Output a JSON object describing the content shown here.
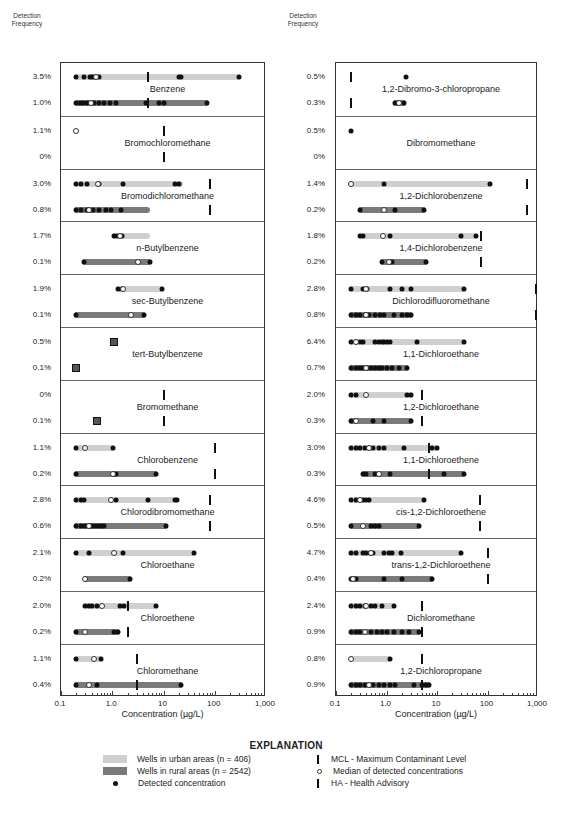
{
  "header": {
    "detection_frequency_label_line1": "Detection",
    "detection_frequency_label_line2": "Frequency"
  },
  "axis": {
    "ticks": [
      "0.1",
      "1.0",
      "10",
      "100",
      "1,000"
    ],
    "tick_values": [
      0.1,
      1,
      10,
      100,
      1000
    ],
    "xlabel": "Concentration (µg/L)"
  },
  "colors": {
    "urban": "#cfcfcf",
    "rural": "#7a7a7a",
    "detected": "#111111",
    "mcl": "#111111"
  },
  "explanation": {
    "title": "EXPLANATION",
    "urban": "Wells in urban areas (n = 406)",
    "rural": "Wells in rural areas (n = 2542)",
    "detected": "Detected concentration",
    "mcl": "MCL - Maximum Contaminant Level",
    "median": "Median of detected concentrations",
    "ha": "HA - Health Advisory"
  },
  "chart_data": {
    "type": "strip/range",
    "title": "",
    "xlabel": "Concentration (µg/L)",
    "xscale": "log",
    "xlim": [
      0.1,
      1000
    ],
    "legend": [
      "Wells in urban areas (n = 406)",
      "Wells in rural areas (n = 2542)",
      "Detected concentration",
      "MCL - Maximum Contaminant Level",
      "Median of detected concentrations",
      "HA - Health Advisory"
    ],
    "panels": [
      [
        {
          "name": "Benzene",
          "urban": {
            "freq": "3.5%",
            "range": [
              0.2,
              300
            ],
            "dots": [
              0.2,
              0.28,
              0.36,
              0.4,
              0.44,
              0.55,
              20,
              22,
              300
            ],
            "median": 0.48
          },
          "rural": {
            "freq": "1.0%",
            "range": [
              0.2,
              70
            ],
            "dots": [
              0.2,
              0.23,
              0.27,
              0.32,
              0.45,
              0.55,
              0.7,
              0.9,
              1.2,
              4.5,
              8,
              10,
              70
            ],
            "median": 0.38
          },
          "mcl": 5
        },
        {
          "name": "Bromochloromethane",
          "urban": {
            "freq": "1.1%",
            "range": null,
            "dots": [],
            "median": 0.2
          },
          "rural": {
            "freq": "0%",
            "range": null,
            "dots": [],
            "median": null
          },
          "mcl": 10
        },
        {
          "name": "Bromodichloromethane",
          "urban": {
            "freq": "3.0%",
            "range": [
              0.2,
              22
            ],
            "dots": [
              0.2,
              0.25,
              0.32,
              0.55,
              1.6,
              17,
              20
            ],
            "median": 0.52
          },
          "rural": {
            "freq": "0.8%",
            "range": [
              0.2,
              5
            ],
            "dots": [
              0.2,
              0.25,
              0.32,
              0.42,
              0.55,
              0.75,
              0.95,
              1.5
            ],
            "median": 0.35
          },
          "mcl": 80
        },
        {
          "name": "n-Butylbenzene",
          "urban": {
            "freq": "1.7%",
            "range": [
              1.1,
              5
            ],
            "dots": [
              1.1,
              1.25,
              1.55
            ],
            "median": 1.4
          },
          "rural": {
            "freq": "0.1%",
            "range": [
              0.28,
              5.5
            ],
            "dots": [
              0.28,
              5.5
            ],
            "median": 3.2
          }
        },
        {
          "name": "sec-Butylbenzene",
          "urban": {
            "freq": "1.9%",
            "range": [
              1.3,
              9.5
            ],
            "dots": [
              1.3,
              1.55,
              9.5
            ],
            "median": 1.6
          },
          "rural": {
            "freq": "0.1%",
            "range": [
              0.2,
              4.2
            ],
            "dots": [
              0.2,
              4.2
            ],
            "median": 2.3
          }
        },
        {
          "name": "tert-Butylbenzene",
          "urban": {
            "freq": "0.5%",
            "range": null,
            "dots": [
              1.1
            ],
            "median": null,
            "square": true
          },
          "rural": {
            "freq": "0.1%",
            "range": null,
            "dots": [
              0.2
            ],
            "median": null,
            "square": true
          }
        },
        {
          "name": "Bromomethane",
          "urban": {
            "freq": "0%",
            "range": null,
            "dots": [],
            "median": null
          },
          "rural": {
            "freq": "0.1%",
            "range": null,
            "dots": [
              0.5
            ],
            "median": null,
            "square": true
          },
          "mcl": 10
        },
        {
          "name": "Chlorobenzene",
          "urban": {
            "freq": "1.1%",
            "range": [
              0.2,
              1.05
            ],
            "dots": [
              0.2,
              1.05
            ],
            "median": 0.3
          },
          "rural": {
            "freq": "0.2%",
            "range": [
              0.2,
              7
            ],
            "dots": [
              0.2,
              1.2,
              7
            ],
            "median": 1.05
          },
          "mcl": 100
        },
        {
          "name": "Chlorodibromomethane",
          "urban": {
            "freq": "2.8%",
            "range": [
              0.2,
              18
            ],
            "dots": [
              0.2,
              0.25,
              0.28,
              1.2,
              5,
              17,
              18
            ],
            "median": 0.95
          },
          "rural": {
            "freq": "0.6%",
            "range": [
              0.2,
              11
            ],
            "dots": [
              0.2,
              0.25,
              0.3,
              0.38,
              0.42,
              0.48,
              0.55,
              0.62,
              0.7,
              11
            ],
            "median": 0.35
          },
          "mcl": 80
        },
        {
          "name": "Chloroethane",
          "urban": {
            "freq": "2.1%",
            "range": [
              0.2,
              40
            ],
            "dots": [
              0.2,
              0.35,
              1.6,
              40
            ],
            "median": 1.1
          },
          "rural": {
            "freq": "0.2%",
            "range": [
              0.3,
              2.2
            ],
            "dots": [
              2.2
            ],
            "median": 0.3
          }
        },
        {
          "name": "Chloroethene",
          "urban": {
            "freq": "2.0%",
            "range": [
              0.3,
              7
            ],
            "dots": [
              0.3,
              0.35,
              0.4,
              0.5,
              1.4,
              1.7,
              7
            ],
            "median": 0.62
          },
          "rural": {
            "freq": "0.2%",
            "range": [
              0.2,
              1.3
            ],
            "dots": [
              0.2,
              1.1,
              1.3
            ],
            "median": 0.3
          },
          "mcl": 2
        },
        {
          "name": "Chloromethane",
          "urban": {
            "freq": "1.1%",
            "range": [
              0.2,
              0.6
            ],
            "dots": [
              0.2,
              0.6
            ],
            "median": 0.45
          },
          "rural": {
            "freq": "0.4%",
            "range": [
              0.2,
              22
            ],
            "dots": [
              0.2,
              0.5,
              22
            ],
            "median": 0.35
          },
          "mcl": 3
        }
      ],
      [
        {
          "name": "1,2-Dibromo-3-chloropropane",
          "urban": {
            "freq": "0.5%",
            "range": null,
            "dots": [
              2.4
            ],
            "median": null
          },
          "rural": {
            "freq": "0.3%",
            "range": [
              1.5,
              2.2
            ],
            "dots": [
              1.5,
              2.2
            ],
            "median": 1.8
          },
          "mcl": 0.2
        },
        {
          "name": "Dibromomethane",
          "urban": {
            "freq": "0.5%",
            "range": null,
            "dots": [
              0.2
            ],
            "median": null
          },
          "rural": {
            "freq": "0%",
            "range": null,
            "dots": [],
            "median": null
          }
        },
        {
          "name": "1,2-Dichlorobenzene",
          "urban": {
            "freq": "1.4%",
            "range": [
              0.2,
              110
            ],
            "dots": [
              0.9,
              110
            ],
            "median": 0.2
          },
          "rural": {
            "freq": "0.2%",
            "range": [
              0.3,
              5.5
            ],
            "dots": [
              0.3,
              1.5,
              5.5
            ],
            "median": 0.9
          },
          "mcl": 600
        },
        {
          "name": "1,4-Dichlorobenzene",
          "urban": {
            "freq": "1.8%",
            "range": [
              0.3,
              60
            ],
            "dots": [
              0.3,
              0.35,
              1.2,
              30,
              60
            ],
            "median": 0.85
          },
          "rural": {
            "freq": "0.2%",
            "range": [
              0.8,
              6
            ],
            "dots": [
              0.8,
              1.3,
              6
            ],
            "median": 1.1
          },
          "mcl": 75
        },
        {
          "name": "Dichlorodifluoromethane",
          "urban": {
            "freq": "2.8%",
            "range": [
              0.2,
              35
            ],
            "dots": [
              0.2,
              0.35,
              0.42,
              1.2,
              2,
              3,
              35
            ],
            "median": 0.4
          },
          "rural": {
            "freq": "0.8%",
            "range": [
              0.2,
              3
            ],
            "dots": [
              0.2,
              0.25,
              0.3,
              0.38,
              0.45,
              0.6,
              0.75,
              0.9,
              1.4,
              2,
              2.5,
              3
            ],
            "median": 0.4
          },
          "mcl": 1000
        },
        {
          "name": "1,1-Dichloroethane",
          "urban": {
            "freq": "6.4%",
            "range": [
              0.2,
              35
            ],
            "dots": [
              0.2,
              0.3,
              0.35,
              0.6,
              0.7,
              0.8,
              0.9,
              1,
              1.2,
              4,
              35
            ],
            "median": 0.25
          },
          "rural": {
            "freq": "0.7%",
            "range": [
              0.2,
              2.5
            ],
            "dots": [
              0.2,
              0.25,
              0.3,
              0.35,
              0.42,
              0.5,
              0.6,
              0.7,
              0.8,
              1,
              1.3,
              1.8,
              2.5
            ],
            "median": 0.4
          }
        },
        {
          "name": "1,2-Dichloroethane",
          "urban": {
            "freq": "2.0%",
            "range": [
              0.2,
              3
            ],
            "dots": [
              0.2,
              0.25,
              2.5,
              3
            ],
            "median": 0.4
          },
          "rural": {
            "freq": "0.3%",
            "range": [
              0.2,
              3
            ],
            "dots": [
              0.2,
              0.55,
              0.9,
              3
            ],
            "median": 0.25
          },
          "mcl": 5
        },
        {
          "name": "1,1-Dichloroethene",
          "urban": {
            "freq": "3.0%",
            "range": [
              0.2,
              10
            ],
            "dots": [
              0.2,
              0.25,
              0.3,
              0.38,
              0.55,
              0.7,
              0.9,
              2.2,
              8,
              10
            ],
            "median": 0.45
          },
          "rural": {
            "freq": "0.3%",
            "range": [
              0.35,
              35
            ],
            "dots": [
              0.35,
              0.4,
              0.6,
              1.2,
              14,
              35
            ],
            "median": 0.7
          },
          "mcl": 7
        },
        {
          "name": "cis-1,2-Dichloroethene",
          "urban": {
            "freq": "4.6%",
            "range": [
              0.2,
              5.5
            ],
            "dots": [
              0.2,
              0.25,
              0.35,
              0.4,
              0.45,
              5.5
            ],
            "median": 0.3
          },
          "rural": {
            "freq": "0.5%",
            "range": [
              0.2,
              4.5
            ],
            "dots": [
              0.2,
              0.5,
              0.6,
              0.7,
              4.5
            ],
            "median": 0.35
          },
          "mcl": 70
        },
        {
          "name": "trans-1,2-Dichloroethene",
          "urban": {
            "freq": "4.7%",
            "range": [
              0.2,
              30
            ],
            "dots": [
              0.2,
              0.25,
              0.35,
              0.4,
              0.48,
              0.55,
              0.9,
              1.1,
              1.3,
              1.9,
              30
            ],
            "median": 0.5
          },
          "rural": {
            "freq": "0.4%",
            "range": [
              0.2,
              8
            ],
            "dots": [
              0.2,
              0.25,
              0.9,
              2,
              8
            ],
            "median": 0.22
          },
          "mcl": 100
        },
        {
          "name": "Dichloromethane",
          "urban": {
            "freq": "2.4%",
            "range": [
              0.2,
              1.4
            ],
            "dots": [
              0.2,
              0.25,
              0.3,
              0.38,
              0.5,
              0.6,
              0.8,
              1.4
            ],
            "median": 0.4
          },
          "rural": {
            "freq": "0.9%",
            "range": [
              0.2,
              4.5
            ],
            "dots": [
              0.2,
              0.25,
              0.3,
              0.5,
              0.65,
              0.8,
              1,
              1.4,
              2,
              2.8,
              4.5
            ],
            "median": 0.38
          },
          "mcl": 5
        },
        {
          "name": "1,2-Dichloropropane",
          "urban": {
            "freq": "0.8%",
            "range": [
              0.2,
              1.2
            ],
            "dots": [
              1.2
            ],
            "median": 0.2
          },
          "rural": {
            "freq": "0.9%",
            "range": [
              0.2,
              7
            ],
            "dots": [
              0.2,
              0.25,
              0.3,
              0.38,
              0.55,
              0.7,
              0.9,
              1.2,
              1.5,
              3.5,
              5,
              6,
              7
            ],
            "median": 0.45
          },
          "mcl": 5
        }
      ]
    ]
  }
}
